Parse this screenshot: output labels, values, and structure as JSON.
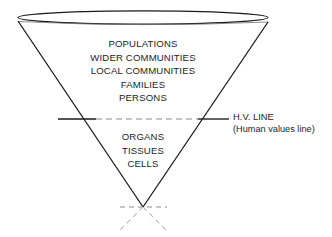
{
  "diagram": {
    "background_color": "#ffffff",
    "stroke_color": "#1a1a1a",
    "dash_color": "#8c8c8c",
    "faint_dash_color": "#b4b4b4",
    "upper_levels": [
      "POPULATIONS",
      "WIDER COMMUNITIES",
      "LOCAL COMMUNITIES",
      "FAMILIES",
      "PERSONS"
    ],
    "lower_levels": [
      "ORGANS",
      "TISSUES",
      "CELLS"
    ],
    "hv_line": {
      "label": "H.V. LINE",
      "sublabel": "(Human values line)"
    }
  }
}
